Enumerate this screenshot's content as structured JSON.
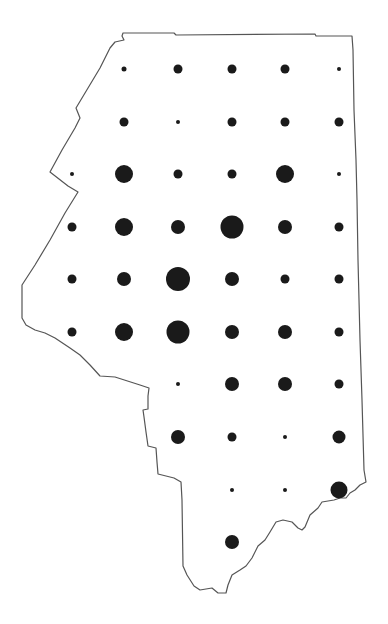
{
  "map": {
    "type": "proportional-symbol-map",
    "outline_color": "#555555",
    "symbol_color": "#1a1a1a",
    "background": "#ffffff",
    "grid": {
      "columns_x": [
        72,
        124,
        178,
        232,
        285,
        339
      ],
      "rows_y": [
        69,
        122,
        174,
        227,
        279,
        332,
        384,
        437,
        490,
        542
      ]
    },
    "symbols": [
      {
        "row": 0,
        "col": 1,
        "x": 124,
        "y": 69,
        "r": 2.5
      },
      {
        "row": 0,
        "col": 2,
        "x": 178,
        "y": 69,
        "r": 4.5
      },
      {
        "row": 0,
        "col": 3,
        "x": 232,
        "y": 69,
        "r": 4.5
      },
      {
        "row": 0,
        "col": 4,
        "x": 285,
        "y": 69,
        "r": 4.5
      },
      {
        "row": 0,
        "col": 5,
        "x": 339,
        "y": 69,
        "r": 2
      },
      {
        "row": 1,
        "col": 1,
        "x": 124,
        "y": 122,
        "r": 4.5
      },
      {
        "row": 1,
        "col": 2,
        "x": 178,
        "y": 122,
        "r": 2
      },
      {
        "row": 1,
        "col": 3,
        "x": 232,
        "y": 122,
        "r": 4.5
      },
      {
        "row": 1,
        "col": 4,
        "x": 285,
        "y": 122,
        "r": 4.5
      },
      {
        "row": 1,
        "col": 5,
        "x": 339,
        "y": 122,
        "r": 4.5
      },
      {
        "row": 2,
        "col": 0,
        "x": 72,
        "y": 174,
        "r": 2
      },
      {
        "row": 2,
        "col": 1,
        "x": 124,
        "y": 174,
        "r": 9
      },
      {
        "row": 2,
        "col": 2,
        "x": 178,
        "y": 174,
        "r": 4.5
      },
      {
        "row": 2,
        "col": 3,
        "x": 232,
        "y": 174,
        "r": 4.5
      },
      {
        "row": 2,
        "col": 4,
        "x": 285,
        "y": 174,
        "r": 9
      },
      {
        "row": 2,
        "col": 5,
        "x": 339,
        "y": 174,
        "r": 2
      },
      {
        "row": 3,
        "col": 0,
        "x": 72,
        "y": 227,
        "r": 4.5
      },
      {
        "row": 3,
        "col": 1,
        "x": 124,
        "y": 227,
        "r": 9
      },
      {
        "row": 3,
        "col": 2,
        "x": 178,
        "y": 227,
        "r": 7
      },
      {
        "row": 3,
        "col": 3,
        "x": 232,
        "y": 227,
        "r": 11.5
      },
      {
        "row": 3,
        "col": 4,
        "x": 285,
        "y": 227,
        "r": 7
      },
      {
        "row": 3,
        "col": 5,
        "x": 339,
        "y": 227,
        "r": 4.5
      },
      {
        "row": 4,
        "col": 0,
        "x": 72,
        "y": 279,
        "r": 4.5
      },
      {
        "row": 4,
        "col": 1,
        "x": 124,
        "y": 279,
        "r": 7
      },
      {
        "row": 4,
        "col": 2,
        "x": 178,
        "y": 279,
        "r": 12
      },
      {
        "row": 4,
        "col": 3,
        "x": 232,
        "y": 279,
        "r": 7
      },
      {
        "row": 4,
        "col": 4,
        "x": 285,
        "y": 279,
        "r": 4.5
      },
      {
        "row": 4,
        "col": 5,
        "x": 339,
        "y": 279,
        "r": 4.5
      },
      {
        "row": 5,
        "col": 0,
        "x": 72,
        "y": 332,
        "r": 4.5
      },
      {
        "row": 5,
        "col": 1,
        "x": 124,
        "y": 332,
        "r": 9
      },
      {
        "row": 5,
        "col": 2,
        "x": 178,
        "y": 332,
        "r": 11.5
      },
      {
        "row": 5,
        "col": 3,
        "x": 232,
        "y": 332,
        "r": 7
      },
      {
        "row": 5,
        "col": 4,
        "x": 285,
        "y": 332,
        "r": 7
      },
      {
        "row": 5,
        "col": 5,
        "x": 339,
        "y": 332,
        "r": 4.5
      },
      {
        "row": 6,
        "col": 2,
        "x": 178,
        "y": 384,
        "r": 2
      },
      {
        "row": 6,
        "col": 3,
        "x": 232,
        "y": 384,
        "r": 7
      },
      {
        "row": 6,
        "col": 4,
        "x": 285,
        "y": 384,
        "r": 7
      },
      {
        "row": 6,
        "col": 5,
        "x": 339,
        "y": 384,
        "r": 4.5
      },
      {
        "row": 7,
        "col": 2,
        "x": 178,
        "y": 437,
        "r": 7
      },
      {
        "row": 7,
        "col": 3,
        "x": 232,
        "y": 437,
        "r": 4.5
      },
      {
        "row": 7,
        "col": 4,
        "x": 285,
        "y": 437,
        "r": 2
      },
      {
        "row": 7,
        "col": 5,
        "x": 339,
        "y": 437,
        "r": 6.5
      },
      {
        "row": 8,
        "col": 3,
        "x": 232,
        "y": 490,
        "r": 2
      },
      {
        "row": 8,
        "col": 4,
        "x": 285,
        "y": 490,
        "r": 2
      },
      {
        "row": 8,
        "col": 5,
        "x": 339,
        "y": 490,
        "r": 8.5
      },
      {
        "row": 9,
        "col": 3,
        "x": 232,
        "y": 542,
        "r": 7
      }
    ],
    "outline_path": "M123,33 L174,33 L176,35 L315,34 L316,36 L352,36 L353,50 L354,110 L356,160 L357,200 L358,260 L359,300 L360,340 L362,400 L364,470 L366,482 L360,485 L355,490 L350,493 L346,498 L340,498 L334,500 L322,502 L318,508 L310,515 L305,527 L302,530 L298,528 L292,522 L283,520 L276,522 L270,532 L265,540 L258,546 L252,558 L246,566 L240,570 L232,575 L228,585 L226,593 L218,593 L212,588 L200,590 L194,586 L187,575 L183,566 L182,500 L181,482 L174,478 L158,474 L157,462 L156,448 L148,446 L146,432 L144,417 L143,410 L148,409 L148,396 L149,388 L140,385 L115,377 L100,376 L90,365 L80,355 L70,348 L55,338 L45,333 L35,330 L26,325 L22,318 L22,300 L22,285 L35,265 L50,240 L65,213 L78,192 L68,186 L50,172 L62,150 L75,128 L80,118 L76,108 L88,88 L100,68 L110,48 L115,42 L124,40 L122,36 Z"
  }
}
